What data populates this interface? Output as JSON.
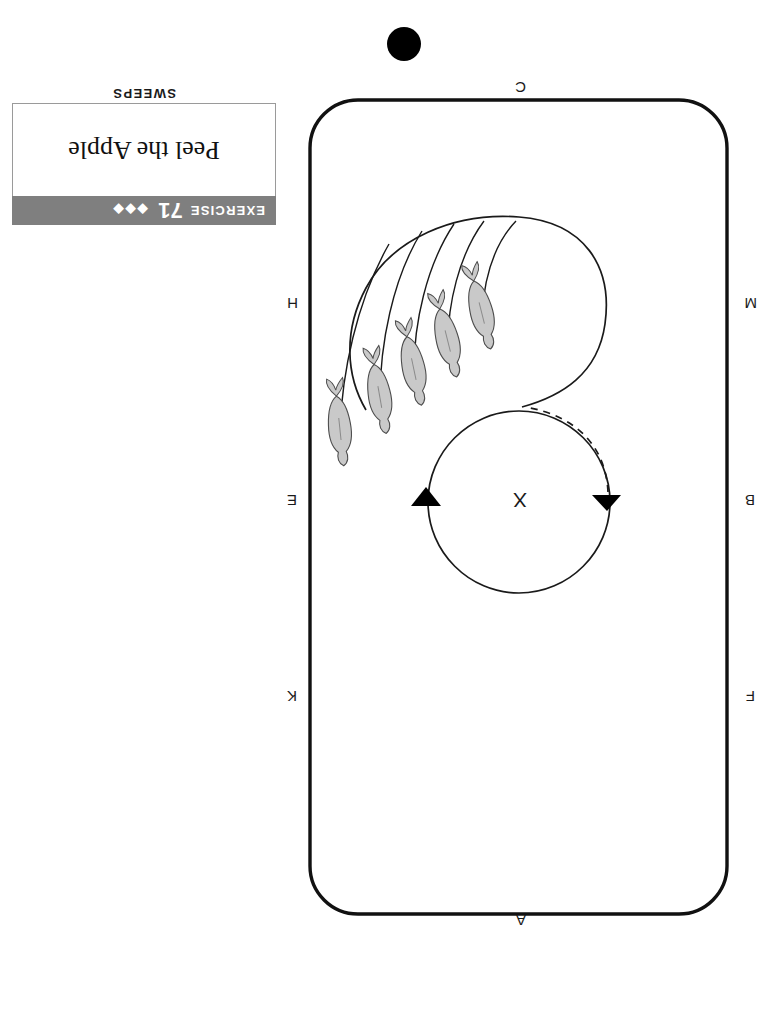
{
  "page": {
    "orientation": "rotated-180",
    "background_color": "#ffffff"
  },
  "caption": {
    "exercise_word": "EXERCISE",
    "exercise_number": "71",
    "difficulty_diamonds": "◆◆◆",
    "difficulty_count": 3,
    "title": "Peel the Apple",
    "banner_color": "#7f7f7f",
    "banner_text_color": "#ffffff"
  },
  "section": {
    "label": "SWEEPS"
  },
  "arena": {
    "shape": "rounded-rectangle",
    "center_marker": "X",
    "letters": [
      {
        "label": "A",
        "position": "top-center"
      },
      {
        "label": "F",
        "position": "left-upper"
      },
      {
        "label": "B",
        "position": "left-middle"
      },
      {
        "label": "M",
        "position": "left-lower"
      },
      {
        "label": "C",
        "position": "bottom-center"
      },
      {
        "label": "H",
        "position": "right-lower"
      },
      {
        "label": "E",
        "position": "right-middle"
      },
      {
        "label": "K",
        "position": "right-upper"
      }
    ]
  },
  "diagram": {
    "pattern_name": "figure-eight-with-nested-sweeps",
    "upper_circle": {
      "direction_arrows": [
        {
          "name": "arrow-left",
          "glyph": "▲"
        },
        {
          "name": "arrow-right",
          "glyph": "▼"
        }
      ],
      "dashed_return_path": true
    },
    "riders": [
      {
        "index": 1
      },
      {
        "index": 2
      },
      {
        "index": 3
      },
      {
        "index": 4
      },
      {
        "index": 5
      }
    ],
    "rider_count": 5,
    "rider_body_color": "#c9c9c9",
    "line_color": "#1a1a1a"
  },
  "page_marker": {
    "shape": "filled-circle",
    "color": "#000000"
  }
}
